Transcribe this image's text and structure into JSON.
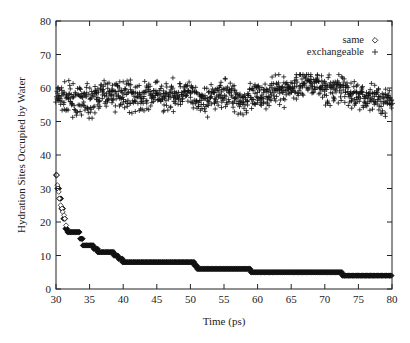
{
  "chart_data": {
    "type": "scatter",
    "title": "",
    "xlabel": "Time (ps)",
    "ylabel": "Hydration Sites Occupied by Water",
    "xlim": [
      30,
      80
    ],
    "ylim": [
      0,
      80
    ],
    "xticks": [
      30,
      35,
      40,
      45,
      50,
      55,
      60,
      65,
      70,
      75,
      80
    ],
    "yticks": [
      0,
      10,
      20,
      30,
      40,
      50,
      60,
      70,
      80
    ],
    "grid": false,
    "legend_position": "top-right",
    "series": [
      {
        "name": "same",
        "marker": "diamond",
        "steps": [
          {
            "x0": 30.0,
            "x1": 30.2,
            "y": 34
          },
          {
            "x0": 30.2,
            "x1": 30.5,
            "y": 30
          },
          {
            "x0": 30.5,
            "x1": 30.8,
            "y": 27
          },
          {
            "x0": 30.8,
            "x1": 31.1,
            "y": 24
          },
          {
            "x0": 31.1,
            "x1": 31.4,
            "y": 21
          },
          {
            "x0": 31.4,
            "x1": 31.7,
            "y": 18
          },
          {
            "x0": 31.7,
            "x1": 33.6,
            "y": 17
          },
          {
            "x0": 33.6,
            "x1": 34.0,
            "y": 15
          },
          {
            "x0": 34.0,
            "x1": 35.6,
            "y": 13
          },
          {
            "x0": 35.6,
            "x1": 36.2,
            "y": 12
          },
          {
            "x0": 36.2,
            "x1": 38.6,
            "y": 11
          },
          {
            "x0": 38.6,
            "x1": 39.3,
            "y": 10
          },
          {
            "x0": 39.3,
            "x1": 39.9,
            "y": 9
          },
          {
            "x0": 39.9,
            "x1": 50.6,
            "y": 8
          },
          {
            "x0": 50.6,
            "x1": 51.0,
            "y": 7
          },
          {
            "x0": 51.0,
            "x1": 59.0,
            "y": 6
          },
          {
            "x0": 59.0,
            "x1": 72.6,
            "y": 5
          },
          {
            "x0": 72.6,
            "x1": 80.0,
            "y": 4
          }
        ]
      },
      {
        "name": "exchangeable",
        "marker": "plus",
        "x": [
          30,
          31,
          32,
          33,
          34,
          35,
          36,
          37,
          38,
          39,
          40,
          41,
          42,
          43,
          44,
          45,
          46,
          47,
          48,
          49,
          50,
          51,
          52,
          53,
          54,
          55,
          56,
          57,
          58,
          59,
          60,
          61,
          62,
          63,
          64,
          65,
          66,
          67,
          68,
          69,
          70,
          71,
          72,
          73,
          74,
          75,
          76,
          77,
          78,
          79,
          80
        ],
        "mean": [
          57,
          57,
          57,
          56,
          56,
          56,
          57,
          58,
          58,
          58,
          59,
          58,
          57,
          57,
          58,
          58,
          57,
          58,
          58,
          59,
          58,
          56,
          56,
          57,
          58,
          59,
          58,
          57,
          56,
          57,
          57,
          58,
          59,
          59,
          59,
          60,
          61,
          62,
          62,
          61,
          60,
          59,
          60,
          59,
          58,
          58,
          57,
          57,
          57,
          56,
          56
        ],
        "range": [
          51,
          64
        ]
      }
    ]
  },
  "legend": {
    "items": [
      {
        "label": "same",
        "symbol": "◇"
      },
      {
        "label": "exchangeable",
        "symbol": "+"
      }
    ]
  },
  "axes": {
    "xlabel": "Time (ps)",
    "ylabel": "Hydration Sites Occupied by Water",
    "xtick_labels": [
      "30",
      "35",
      "40",
      "45",
      "50",
      "55",
      "60",
      "65",
      "70",
      "75",
      "80"
    ],
    "ytick_labels": [
      "0",
      "10",
      "20",
      "30",
      "40",
      "50",
      "60",
      "70",
      "80"
    ]
  }
}
